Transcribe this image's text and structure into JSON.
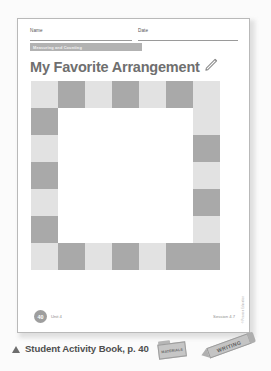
{
  "sheet": {
    "name_label": "Name",
    "date_label": "Date",
    "unit_banner_label": "Measuring and Counting",
    "title": "My Favorite Arrangement",
    "title_icon": "pencil-icon",
    "copyright_vertical": "© Pearson Education",
    "footer": {
      "page_number": "40",
      "unit_note": "Unit 4",
      "session_note": "Session 4.7"
    }
  },
  "grid": {
    "columns": 7,
    "rows": 7,
    "cell_size_px": 27,
    "colors": {
      "dark": "#a9a9a9",
      "light": "#e2e2e2",
      "empty": "#ffffff"
    },
    "pattern": [
      [
        "light",
        "dark",
        "light",
        "dark",
        "light",
        "dark",
        "light"
      ],
      [
        "dark",
        "empty",
        "empty",
        "empty",
        "empty",
        "empty",
        "light"
      ],
      [
        "light",
        "empty",
        "empty",
        "empty",
        "empty",
        "empty",
        "dark"
      ],
      [
        "dark",
        "empty",
        "empty",
        "empty",
        "empty",
        "empty",
        "light"
      ],
      [
        "light",
        "empty",
        "empty",
        "empty",
        "empty",
        "empty",
        "dark"
      ],
      [
        "dark",
        "empty",
        "empty",
        "empty",
        "empty",
        "empty",
        "light"
      ],
      [
        "light",
        "dark",
        "light",
        "dark",
        "light",
        "dark",
        "dark"
      ]
    ]
  },
  "caption": {
    "marker_icon": "triangle-up-icon",
    "text": "Student Activity Book, p. 40",
    "tags": [
      {
        "name": "folder-tag",
        "label": "MATERIALS"
      },
      {
        "name": "writing-pencil-tag",
        "label": "WRITING"
      }
    ]
  }
}
